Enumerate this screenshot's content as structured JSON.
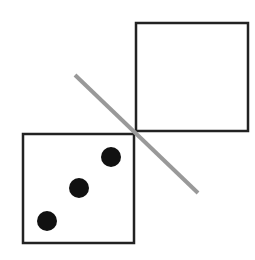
{
  "diagram": {
    "colors": {
      "background": "#ffffff",
      "outline": "#222222",
      "pip": "#111111",
      "mirror_line": "#999999"
    },
    "top_right_square": {
      "x": 136,
      "y": 23,
      "width": 112,
      "height": 108,
      "pips": 0
    },
    "bottom_left_square": {
      "x": 23,
      "y": 134,
      "width": 111,
      "height": 109,
      "pips": 3
    },
    "pips": [
      {
        "cx": 111,
        "cy": 157,
        "r": 10
      },
      {
        "cx": 79,
        "cy": 188,
        "r": 10
      },
      {
        "cx": 47,
        "cy": 221,
        "r": 10
      }
    ],
    "mirror_line": {
      "x1": 75,
      "y1": 75,
      "x2": 198,
      "y2": 193,
      "width": 4
    }
  }
}
